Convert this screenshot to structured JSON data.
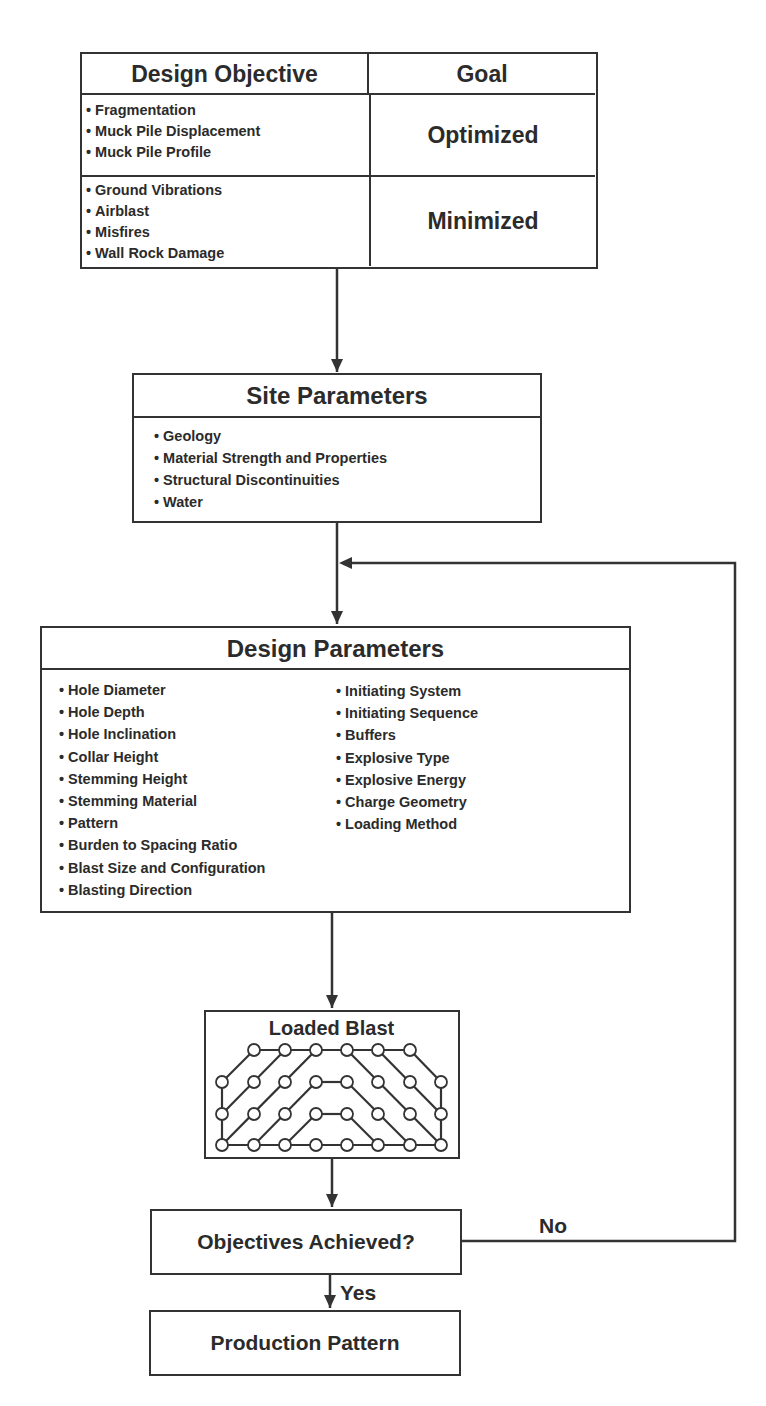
{
  "objective_table": {
    "col_headers": [
      "Design Objective",
      "Goal"
    ],
    "rows": [
      {
        "items": [
          "Fragmentation",
          "Muck Pile Displacement",
          "Muck Pile Profile"
        ],
        "goal": "Optimized"
      },
      {
        "items": [
          "Ground Vibrations",
          "Airblast",
          "Misfires",
          "Wall Rock Damage"
        ],
        "goal": "Minimized"
      }
    ]
  },
  "site_parameters": {
    "title": "Site Parameters",
    "items": [
      "Geology",
      "Material Strength and Properties",
      "Structural Discontinuities",
      "Water"
    ]
  },
  "design_parameters": {
    "title": "Design Parameters",
    "left_items": [
      "Hole Diameter",
      "Hole Depth",
      "Hole Inclination",
      "Collar Height",
      "Stemming Height",
      "Stemming Material",
      "Pattern",
      "Burden to Spacing Ratio",
      "Blast Size and Configuration",
      "Blasting Direction"
    ],
    "right_items": [
      "Initiating System",
      "Initiating Sequence",
      "Buffers",
      "Explosive Type",
      "Explosive Energy",
      "Charge Geometry",
      "Loading Method"
    ]
  },
  "loaded_blast": {
    "title": "Loaded Blast"
  },
  "decision": {
    "label": "Objectives Achieved?",
    "yes_label": "Yes",
    "no_label": "No"
  },
  "result": {
    "label": "Production Pattern"
  },
  "colors": {
    "stroke": "#333333",
    "text": "#2b2b2b",
    "background": "#ffffff"
  }
}
